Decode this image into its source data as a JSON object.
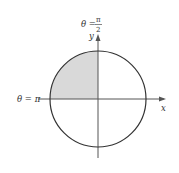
{
  "diagram": {
    "type": "polar-region",
    "labels": {
      "theta_top": "θ = ",
      "theta_top_num": "π",
      "theta_top_den": "2",
      "theta_left": "θ = π",
      "y_axis": "y",
      "x_axis": "x"
    },
    "colors": {
      "circle": "#333333",
      "axes": "#555555",
      "shade": "#d9d9d9"
    },
    "shaded_region": {
      "theta_start": "π/2",
      "theta_end": "π"
    }
  }
}
